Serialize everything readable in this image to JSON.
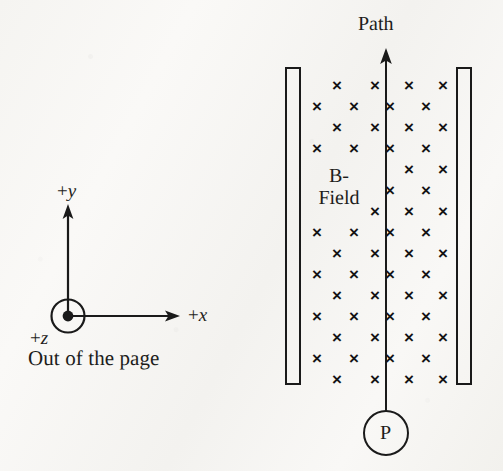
{
  "figure": {
    "background_color": "#f7f6f3",
    "ink_color": "#1a1a1a"
  },
  "axes": {
    "y_label_sign": "+",
    "y_label_var": "y",
    "x_label_sign": "+",
    "x_label_var": "x",
    "z_label_sign": "+",
    "z_label_var": "z",
    "z_description": "Out of the page",
    "origin_marker": "out-of-page-dot"
  },
  "field": {
    "label_line1": "B-",
    "label_line2": "Field",
    "symbol": "×",
    "symbol_name": "into-page-cross",
    "direction": "into the page",
    "columns_per_row": 4,
    "rows": 15,
    "x_positions_even": [
      337,
      375,
      409,
      443
    ],
    "x_positions_odd": [
      317,
      354,
      390,
      426
    ],
    "row_y_positions": [
      85,
      106,
      127,
      148,
      169,
      190,
      211,
      232,
      253,
      274,
      295,
      316,
      337,
      358,
      379
    ]
  },
  "plates": {
    "left": {
      "x": 286,
      "y": 68,
      "width": 14,
      "height": 316
    },
    "right": {
      "x": 457,
      "y": 68,
      "width": 14,
      "height": 316
    }
  },
  "path": {
    "label": "Path",
    "direction": "upward",
    "line_x": 386,
    "arrow_top_y": 50,
    "start_y": 411
  },
  "particle": {
    "label": "P",
    "center_x": 386,
    "center_y": 433,
    "radius": 22
  }
}
